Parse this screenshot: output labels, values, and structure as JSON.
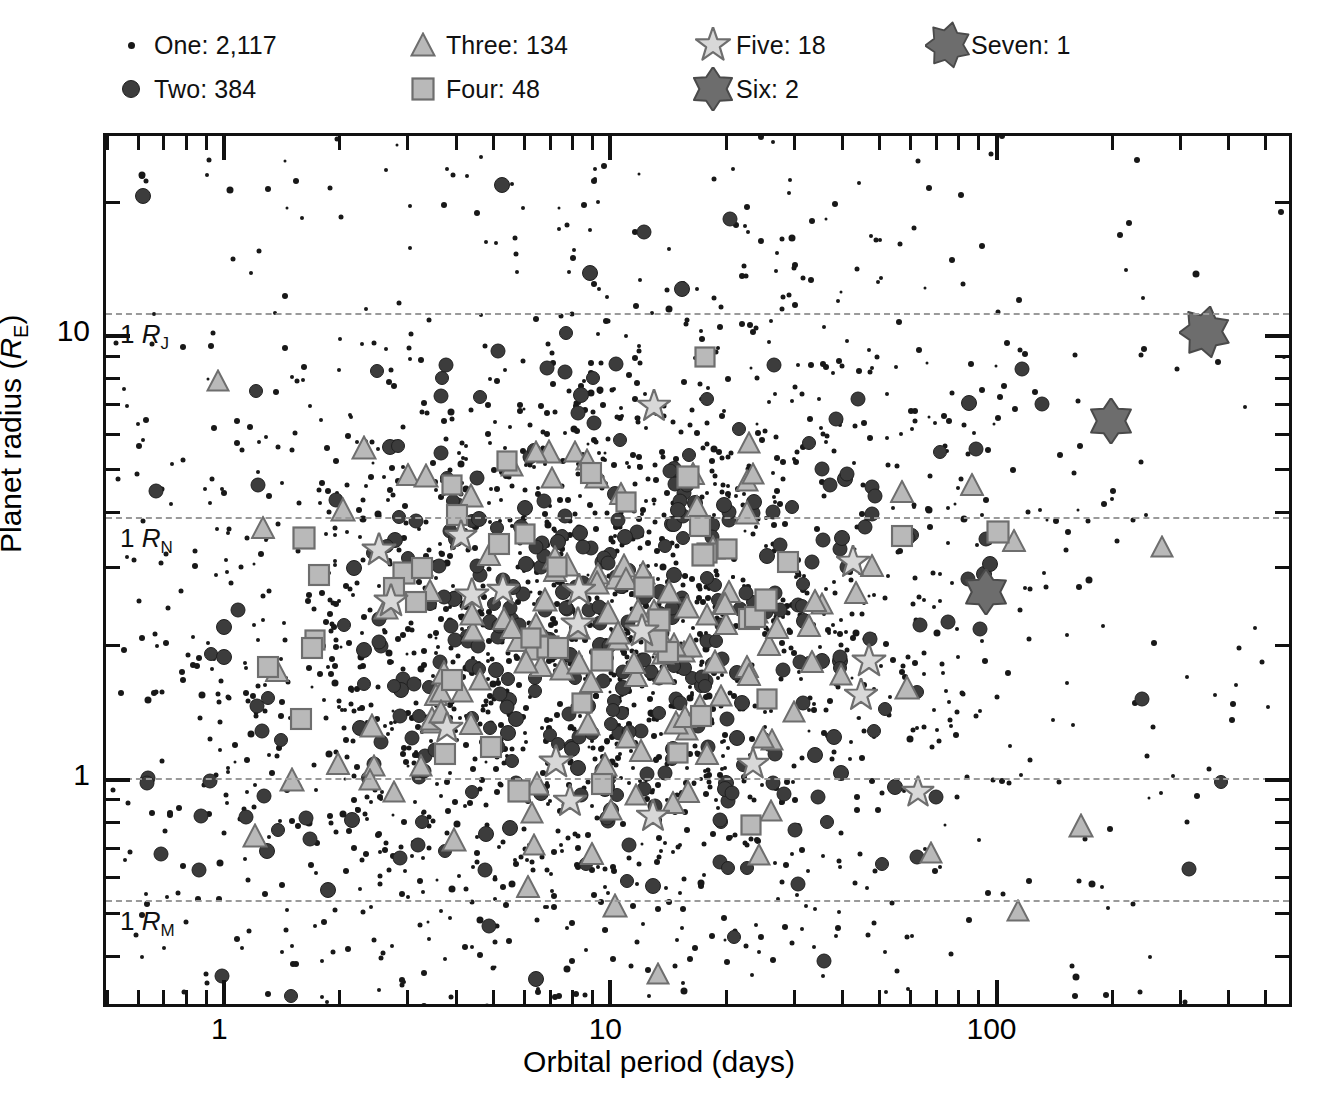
{
  "legend": {
    "items": [
      {
        "key": "one",
        "marker": "small-dot",
        "label": "One: 2,117",
        "count": 2117,
        "col": 0,
        "row": 0
      },
      {
        "key": "two",
        "marker": "filled-circle",
        "label": "Two: 384",
        "count": 384,
        "col": 0,
        "row": 1
      },
      {
        "key": "three",
        "marker": "triangle",
        "label": "Three: 134",
        "count": 134,
        "col": 1,
        "row": 0
      },
      {
        "key": "four",
        "marker": "square",
        "label": "Four: 48",
        "count": 48,
        "col": 1,
        "row": 1
      },
      {
        "key": "five",
        "marker": "five-point-star",
        "label": "Five: 18",
        "count": 18,
        "col": 2,
        "row": 0
      },
      {
        "key": "six",
        "marker": "six-point-star",
        "label": "Six: 2",
        "count": 2,
        "col": 2,
        "row": 1
      },
      {
        "key": "seven",
        "marker": "seven-point-star",
        "label": "Seven: 1",
        "count": 1,
        "col": 3,
        "row": 0
      }
    ]
  },
  "chart_data": {
    "type": "scatter",
    "title": "",
    "xlabel": "Orbital period (days)",
    "ylabel": "Planet radius (R_E)",
    "ylabel_text": "Planet radius (",
    "ylabel_italic": "R",
    "ylabel_sub": "E",
    "ylabel_tail": ")",
    "xscale": "log",
    "yscale": "log",
    "xlim": [
      0.5,
      600
    ],
    "ylim": [
      0.3,
      28
    ],
    "grid": false,
    "legend_position": "above-plot",
    "xticks_major": [
      1,
      10,
      100
    ],
    "xticklabels": [
      "1",
      "10",
      "100"
    ],
    "yticks_major": [
      1,
      10
    ],
    "yticklabels": [
      "1",
      "10"
    ],
    "reference_lines": [
      {
        "name": "jupiter",
        "label_text": "1 ",
        "label_italic": "R",
        "label_sub": "J",
        "value": 11.2,
        "style": "dashed",
        "color": "#9a9a9a"
      },
      {
        "name": "neptune",
        "label_text": "1 ",
        "label_italic": "R",
        "label_sub": "N",
        "value": 3.88,
        "style": "dashed",
        "color": "#9a9a9a"
      },
      {
        "name": "earth",
        "label_text": "",
        "label_italic": "",
        "label_sub": "",
        "value": 1.0,
        "style": "dashed",
        "color": "#9a9a9a"
      },
      {
        "name": "mars",
        "label_text": "1 ",
        "label_italic": "R",
        "label_sub": "M",
        "value": 0.53,
        "style": "dashed",
        "color": "#9a9a9a"
      }
    ],
    "series": [
      {
        "name": "One",
        "count": 2117,
        "marker": "small-dot",
        "fill": "#181818",
        "stroke": "#181818",
        "size": 5
      },
      {
        "name": "Two",
        "count": 384,
        "marker": "filled-circle",
        "fill": "#3c3c3c",
        "stroke": "#202020",
        "size": 15
      },
      {
        "name": "Three",
        "count": 134,
        "marker": "triangle",
        "fill": "#b9b9b9",
        "stroke": "#6e6e6e",
        "size": 25
      },
      {
        "name": "Four",
        "count": 48,
        "marker": "square",
        "fill": "#b9b9b9",
        "stroke": "#6e6e6e",
        "size": 23
      },
      {
        "name": "Five",
        "count": 18,
        "marker": "five-point-star",
        "fill": "#d8d8d8",
        "stroke": "#6e6e6e",
        "size": 34
      },
      {
        "name": "Six",
        "count": 2,
        "marker": "six-point-star",
        "fill": "#6d6d6d",
        "stroke": "#4a4a4a",
        "size": 46
      },
      {
        "name": "Seven",
        "count": 1,
        "marker": "seven-point-star",
        "fill": "#6d6d6d",
        "stroke": "#4a4a4a",
        "size": 52
      }
    ],
    "cluster_center": {
      "period": 9.0,
      "radius": 2.1
    }
  },
  "colors": {
    "axis": "#111111",
    "refline": "#9a9a9a",
    "one": "#181818",
    "two": "#3c3c3c",
    "light_fill": "#b9b9b9",
    "light_stroke": "#6e6e6e",
    "star_fill": "#d8d8d8",
    "big_star_fill": "#6d6d6d",
    "background": "#ffffff"
  }
}
